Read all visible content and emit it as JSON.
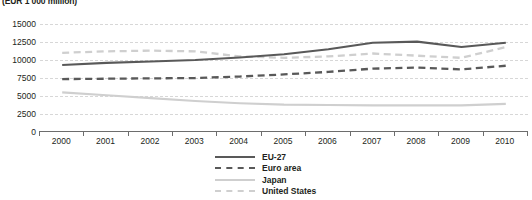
{
  "caption": "(EUR 1 000 million)",
  "legend": {
    "items": [
      {
        "label": "EU-27",
        "key": "eu27",
        "swatch": "sw-eu"
      },
      {
        "label": "Euro area",
        "key": "euro_area",
        "swatch": "sw-ea"
      },
      {
        "label": "Japan",
        "key": "japan",
        "swatch": "sw-jp"
      },
      {
        "label": "United States",
        "key": "united_states",
        "swatch": "sw-us"
      }
    ]
  },
  "colors": {
    "dark_series": "#595959",
    "light_series": "#cfcfcf",
    "gridline": "#d7d7d7",
    "axis": "#6d6d6d",
    "text": "#231f20"
  },
  "chart_data": {
    "type": "line",
    "title": "",
    "subtitle": "(EUR 1 000 million)",
    "xlabel": "",
    "ylabel": "",
    "categories": [
      "2000",
      "2001",
      "2002",
      "2003",
      "2004",
      "2005",
      "2006",
      "2007",
      "2008",
      "2009",
      "2010"
    ],
    "x": [
      2000,
      2001,
      2002,
      2003,
      2004,
      2005,
      2006,
      2007,
      2008,
      2009,
      2010
    ],
    "yticks": [
      0,
      2500,
      5000,
      7500,
      10000,
      12500,
      15000
    ],
    "ytick_labels": [
      "0",
      "2500",
      "5000",
      "7500",
      "10000",
      "12500",
      "15000"
    ],
    "ylim": [
      0,
      15000
    ],
    "grid": true,
    "legend_position": "bottom-center",
    "series": [
      {
        "name": "EU-27",
        "style": "solid",
        "color": "#595959",
        "values": [
          9300,
          9600,
          9800,
          10000,
          10350,
          10800,
          11500,
          12400,
          12550,
          11800,
          12400
        ]
      },
      {
        "name": "Euro area",
        "style": "dashed",
        "color": "#595959",
        "values": [
          7350,
          7400,
          7450,
          7500,
          7700,
          8000,
          8350,
          8800,
          8950,
          8700,
          9200
        ]
      },
      {
        "name": "Japan",
        "style": "solid",
        "color": "#cfcfcf",
        "values": [
          5500,
          5100,
          4700,
          4300,
          4000,
          3800,
          3750,
          3700,
          3700,
          3700,
          3900
        ]
      },
      {
        "name": "United States",
        "style": "dashed",
        "color": "#cfcfcf",
        "values": [
          11000,
          11200,
          11300,
          11200,
          10500,
          10300,
          10500,
          10900,
          10600,
          10300,
          11800
        ]
      }
    ]
  }
}
